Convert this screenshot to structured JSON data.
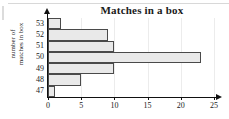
{
  "chart_data": {
    "type": "bar",
    "orientation": "horizontal",
    "title": "Matches in a box",
    "xlabel": "",
    "ylabel_lines": [
      "number of",
      "matches in box"
    ],
    "categories": [
      "53",
      "52",
      "51",
      "50",
      "49",
      "48",
      "47"
    ],
    "values": [
      2,
      9,
      10,
      23,
      10,
      5,
      1
    ],
    "xlim": [
      0,
      25
    ],
    "xticks": [
      0,
      5,
      10,
      15,
      20,
      25
    ],
    "xtick_labels": [
      "0",
      "5",
      "10",
      "15",
      "20",
      "25"
    ],
    "grid": true,
    "legend": null,
    "bar_fill": "#e9e9e9",
    "bar_border": "#4a4a4a",
    "axis_color": "#111111",
    "text_color": "#1a1a1a"
  }
}
